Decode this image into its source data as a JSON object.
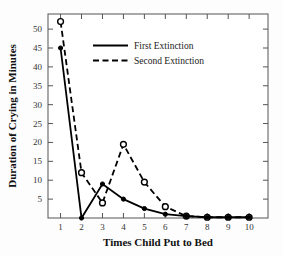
{
  "chart_data": {
    "type": "line",
    "title": "",
    "xlabel": "Times Child Put to Bed",
    "ylabel": "Duration of Crying in Minutes",
    "x": [
      1,
      2,
      3,
      4,
      5,
      6,
      7,
      8,
      9,
      10
    ],
    "xticklabels": [
      "1",
      "2",
      "3",
      "4",
      "5",
      "6",
      "7",
      "8",
      "9",
      "10"
    ],
    "yticklabels": [
      "5",
      "10",
      "15",
      "20",
      "25",
      "30",
      "35",
      "40",
      "45",
      "50"
    ],
    "yticks": [
      5,
      10,
      15,
      20,
      25,
      30,
      35,
      40,
      45,
      50
    ],
    "xlim": [
      0.4,
      10.9
    ],
    "ylim": [
      0,
      54
    ],
    "grid": false,
    "legend_position": "upper center",
    "series": [
      {
        "name": "First Extinction",
        "style": "solid",
        "marker": "filled-circle",
        "values": [
          45,
          0,
          9,
          5,
          2.5,
          1,
          0.5,
          0.2,
          0.2,
          0.2
        ]
      },
      {
        "name": "Second Extinction",
        "style": "dashed",
        "marker": "open-circle",
        "values": [
          52,
          12,
          4,
          19.5,
          9.5,
          3,
          0.5,
          0.2,
          0.2,
          0.2
        ]
      }
    ]
  },
  "axes": {
    "frame": "box",
    "tick_sides": [
      "left",
      "bottom",
      "top",
      "right"
    ]
  },
  "legend": {
    "items": [
      {
        "label": "First Extinction",
        "style": "solid"
      },
      {
        "label": "Second Extinction",
        "style": "dashed"
      }
    ]
  }
}
